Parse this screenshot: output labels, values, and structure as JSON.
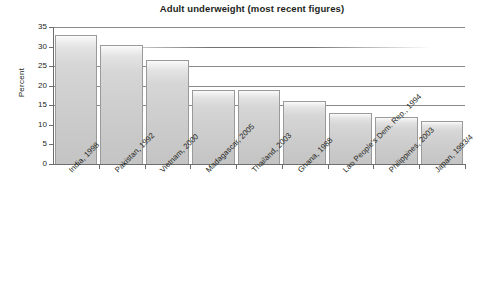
{
  "chart_data": {
    "type": "bar",
    "title": "Adult underweight (most recent figures)",
    "xlabel": "",
    "ylabel": "Percent",
    "ylim": [
      0,
      35
    ],
    "yticks": [
      0,
      5,
      10,
      15,
      20,
      25,
      30,
      35
    ],
    "ytick_labels": [
      "0",
      "5",
      "10",
      "15",
      "20",
      "25",
      "30",
      "35"
    ],
    "grid": true,
    "legend": "none",
    "categories": [
      "India, 1998",
      "Pakistan, 1992",
      "Vietnam, 2000",
      "Madagascar, 2005",
      "Thailand, 2003",
      "Ghana, 1988",
      "Lao People's Dem. Rep., 1994",
      "Philippines, 2003",
      "Japan, 1993/4"
    ],
    "values": [
      33,
      30.5,
      26.5,
      19,
      19,
      16,
      13,
      12,
      11
    ],
    "bar_color": "#d3d3d3",
    "bar_border_color": "#9a9a9a",
    "axis_color": "#6e6e6e",
    "text_color": "#231f20"
  }
}
